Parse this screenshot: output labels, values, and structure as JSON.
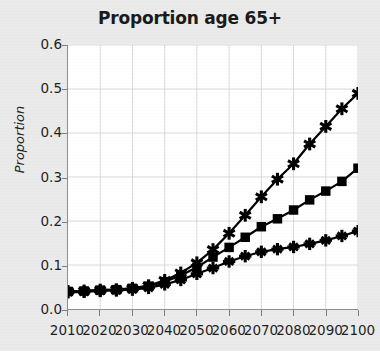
{
  "chart_data": {
    "type": "line",
    "title": "Proportion age 65+",
    "xlabel": "",
    "ylabel": "Proportion",
    "xlim": [
      2010,
      2100
    ],
    "ylim": [
      0.0,
      0.6
    ],
    "grid": true,
    "legend": "none",
    "x_tick_labels": [
      "2010",
      "2020",
      "2030",
      "2040",
      "2050",
      "2060",
      "2070",
      "2080",
      "2090",
      "2100"
    ],
    "y_tick_labels": [
      "0.0",
      "0.1",
      "0.2",
      "0.3",
      "0.4",
      "0.5",
      "0.6"
    ],
    "x": [
      2010,
      2015,
      2020,
      2025,
      2030,
      2035,
      2040,
      2045,
      2050,
      2055,
      2060,
      2065,
      2070,
      2075,
      2080,
      2085,
      2090,
      2095,
      2100
    ],
    "series": [
      {
        "name": "high-scenario",
        "marker": "star",
        "values": [
          0.04,
          0.041,
          0.043,
          0.044,
          0.047,
          0.053,
          0.065,
          0.082,
          0.105,
          0.135,
          0.172,
          0.213,
          0.255,
          0.295,
          0.33,
          0.375,
          0.415,
          0.455,
          0.49
        ]
      },
      {
        "name": "mid-scenario",
        "marker": "square",
        "values": [
          0.04,
          0.041,
          0.043,
          0.044,
          0.047,
          0.052,
          0.062,
          0.076,
          0.095,
          0.118,
          0.14,
          0.163,
          0.187,
          0.205,
          0.225,
          0.248,
          0.268,
          0.29,
          0.32
        ]
      },
      {
        "name": "low-scenario",
        "marker": "plus-star",
        "values": [
          0.038,
          0.039,
          0.041,
          0.042,
          0.044,
          0.048,
          0.056,
          0.066,
          0.08,
          0.093,
          0.108,
          0.12,
          0.13,
          0.136,
          0.141,
          0.148,
          0.156,
          0.166,
          0.177
        ]
      }
    ]
  }
}
